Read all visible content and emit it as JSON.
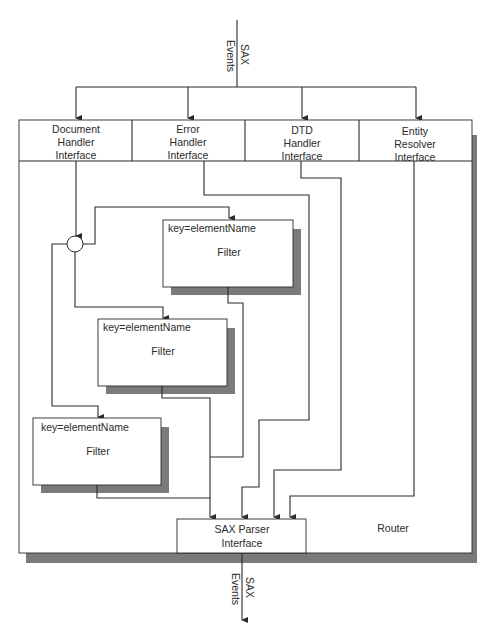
{
  "diagram": {
    "input_label": {
      "line1": "SAX",
      "line2": "Events"
    },
    "output_label": {
      "line1": "SAX",
      "line2": "Events"
    },
    "router_label": "Router",
    "interfaces": [
      {
        "id": "document",
        "lines": [
          "Document",
          "Handler",
          "Interface"
        ]
      },
      {
        "id": "error",
        "lines": [
          "Error",
          "Handler",
          "Interface"
        ]
      },
      {
        "id": "dtd",
        "lines": [
          "DTD",
          "Handler",
          "Interface"
        ]
      },
      {
        "id": "entity",
        "lines": [
          "Entity",
          "Resolver",
          "Interface"
        ]
      }
    ],
    "filters": [
      {
        "key_label": "key=elementName",
        "name": "Filter"
      },
      {
        "key_label": "key=elementName",
        "name": "Filter"
      },
      {
        "key_label": "key=elementName",
        "name": "Filter"
      }
    ],
    "parser": {
      "lines": [
        "SAX Parser",
        "Interface"
      ]
    },
    "colors": {
      "line": "#2a2a2a",
      "shadow": "#7a7a7a",
      "background": "#ffffff"
    }
  }
}
